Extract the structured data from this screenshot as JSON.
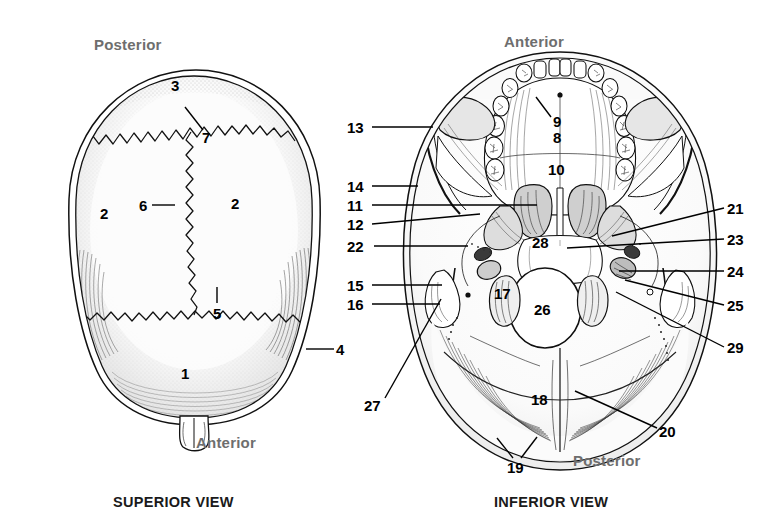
{
  "figure": {
    "background_color": "#ffffff",
    "ink_color": "#000000",
    "orientation_label_color": "#6e6e6e",
    "title_color": "#1a1a1a"
  },
  "panels": [
    {
      "id": "superior",
      "title": "SUPERIOR VIEW",
      "title_pos": {
        "x": 113,
        "y": 494
      },
      "orientation_labels": [
        {
          "name": "posterior",
          "text": "Posterior",
          "x": 94,
          "y": 36
        },
        {
          "name": "anterior",
          "text": "Anterior",
          "x": 196,
          "y": 434
        }
      ],
      "callouts": [
        {
          "id": "3",
          "text": "3",
          "x": 171,
          "y": 78,
          "leader": null
        },
        {
          "id": "7",
          "text": "7",
          "x": 202,
          "y": 130,
          "leader": {
            "x1": 203,
            "y1": 130,
            "x2": 185,
            "y2": 107
          }
        },
        {
          "id": "2L",
          "text": "2",
          "x": 100,
          "y": 206,
          "leader": null
        },
        {
          "id": "6",
          "text": "6",
          "x": 139,
          "y": 198,
          "leader": {
            "x1": 152,
            "y1": 205,
            "x2": 175,
            "y2": 205
          }
        },
        {
          "id": "2R",
          "text": "2",
          "x": 231,
          "y": 196,
          "leader": null
        },
        {
          "id": "5",
          "text": "5",
          "x": 213,
          "y": 306,
          "leader": {
            "x1": 217,
            "y1": 303,
            "x2": 217,
            "y2": 287
          }
        },
        {
          "id": "4",
          "text": "4",
          "x": 336,
          "y": 342,
          "leader": {
            "x1": 334,
            "y1": 349,
            "x2": 306,
            "y2": 349
          }
        },
        {
          "id": "1",
          "text": "1",
          "x": 181,
          "y": 366,
          "leader": null
        }
      ]
    },
    {
      "id": "inferior",
      "title": "INFERIOR VIEW",
      "title_pos": {
        "x": 494,
        "y": 494
      },
      "orientation_labels": [
        {
          "name": "anterior",
          "text": "Anterior",
          "x": 504,
          "y": 33
        },
        {
          "name": "posterior",
          "text": "Posterior",
          "x": 573,
          "y": 452
        }
      ],
      "callouts": [
        {
          "id": "13",
          "text": "13",
          "x": 347,
          "y": 120,
          "leader": {
            "x1": 372,
            "y1": 127,
            "x2": 433,
            "y2": 127
          }
        },
        {
          "id": "14",
          "text": "14",
          "x": 347,
          "y": 179,
          "leader": {
            "x1": 372,
            "y1": 186,
            "x2": 418,
            "y2": 186
          }
        },
        {
          "id": "11",
          "text": "11",
          "x": 347,
          "y": 198,
          "leader": {
            "x1": 372,
            "y1": 205,
            "x2": 537,
            "y2": 205
          }
        },
        {
          "id": "12",
          "text": "12",
          "x": 347,
          "y": 217,
          "leader": {
            "x1": 372,
            "y1": 224,
            "x2": 480,
            "y2": 214
          }
        },
        {
          "id": "22",
          "text": "22",
          "x": 347,
          "y": 239,
          "leader": {
            "x1": 374,
            "y1": 246,
            "x2": 468,
            "y2": 246
          }
        },
        {
          "id": "15",
          "text": "15",
          "x": 347,
          "y": 278,
          "leader": {
            "x1": 372,
            "y1": 285,
            "x2": 442,
            "y2": 285
          }
        },
        {
          "id": "16",
          "text": "16",
          "x": 347,
          "y": 297,
          "leader": {
            "x1": 372,
            "y1": 304,
            "x2": 440,
            "y2": 304
          }
        },
        {
          "id": "9",
          "text": "9",
          "x": 553,
          "y": 114,
          "leader": {
            "x1": 551,
            "y1": 117,
            "x2": 536,
            "y2": 97
          }
        },
        {
          "id": "8",
          "text": "8",
          "x": 553,
          "y": 130,
          "leader": null
        },
        {
          "id": "10",
          "text": "10",
          "x": 548,
          "y": 162,
          "leader": null
        },
        {
          "id": "28",
          "text": "28",
          "x": 532,
          "y": 235,
          "leader": null
        },
        {
          "id": "17",
          "text": "17",
          "x": 494,
          "y": 286,
          "leader": null
        },
        {
          "id": "26",
          "text": "26",
          "x": 534,
          "y": 302,
          "leader": null
        },
        {
          "id": "18",
          "text": "18",
          "x": 531,
          "y": 392,
          "leader": null
        },
        {
          "id": "27",
          "text": "27",
          "x": 364,
          "y": 398,
          "leader": {
            "x1": 385,
            "y1": 398,
            "x2": 441,
            "y2": 299
          }
        },
        {
          "id": "19",
          "text": "19",
          "x": 507,
          "y": 460,
          "leader": {
            "x1": 513,
            "y1": 458,
            "x2": 497,
            "y2": 438
          }
        },
        {
          "id": "19b",
          "text": "",
          "x": 0,
          "y": 0,
          "leader": {
            "x1": 521,
            "y1": 458,
            "x2": 537,
            "y2": 437
          }
        },
        {
          "id": "20",
          "text": "20",
          "x": 659,
          "y": 424,
          "leader": {
            "x1": 657,
            "y1": 428,
            "x2": 575,
            "y2": 391
          }
        },
        {
          "id": "21",
          "text": "21",
          "x": 727,
          "y": 201,
          "leader": {
            "x1": 724,
            "y1": 208,
            "x2": 612,
            "y2": 236
          }
        },
        {
          "id": "23",
          "text": "23",
          "x": 727,
          "y": 232,
          "leader": {
            "x1": 724,
            "y1": 239,
            "x2": 567,
            "y2": 248
          }
        },
        {
          "id": "24",
          "text": "24",
          "x": 727,
          "y": 264,
          "leader": {
            "x1": 724,
            "y1": 271,
            "x2": 619,
            "y2": 271
          }
        },
        {
          "id": "25",
          "text": "25",
          "x": 727,
          "y": 298,
          "leader": {
            "x1": 724,
            "y1": 305,
            "x2": 625,
            "y2": 280
          }
        },
        {
          "id": "29",
          "text": "29",
          "x": 727,
          "y": 340,
          "leader": {
            "x1": 724,
            "y1": 347,
            "x2": 616,
            "y2": 292
          }
        }
      ]
    }
  ]
}
